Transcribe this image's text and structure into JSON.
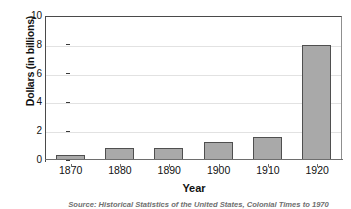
{
  "chart_data": {
    "type": "bar",
    "title": "",
    "xlabel": "Year",
    "ylabel": "Dollars (in billions)",
    "categories": [
      "1870",
      "1880",
      "1890",
      "1900",
      "1910",
      "1920"
    ],
    "values": [
      0.35,
      0.8,
      0.8,
      1.25,
      1.6,
      8.0
    ],
    "ylim": [
      0,
      10
    ],
    "yticks": [
      "0",
      "2",
      "4",
      "6",
      "8",
      "10"
    ],
    "ytick_values": [
      0,
      2,
      4,
      6,
      8,
      10
    ],
    "grid": "horizontal",
    "legend": "none",
    "bar_color": "#a9a9a9",
    "bar_border_color": "#4f4f4f",
    "gridline_color": "#e2e2e2",
    "axis_color": "#4a4a4a"
  },
  "source_note": "Source: Historical Statistics of the United States, Colonial Times to 1970"
}
